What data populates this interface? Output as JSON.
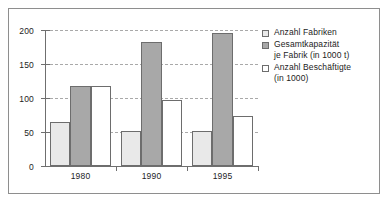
{
  "chart_data": {
    "type": "bar",
    "title": "",
    "subtitle": "",
    "xlabel": "",
    "ylabel": "",
    "categories": [
      "1980",
      "1990",
      "1995"
    ],
    "series": [
      {
        "name": "Anzahl Fabriken",
        "name_line1": "Anzahl Fabriken",
        "name_line2": "",
        "color": "#e9e9e9",
        "values": [
          64,
          51,
          51
        ]
      },
      {
        "name": "Gesamtkapazität je Fabrik (in 1000 t)",
        "name_line1": "Gesamtkapazität",
        "name_line2": "je Fabrik (in 1000 t)",
        "color": "#a8a8a8",
        "values": [
          117,
          183,
          195
        ]
      },
      {
        "name": "Anzahl Beschäftigte (in 1000)",
        "name_line1": "Anzahl Beschäftigte",
        "name_line2": "(in 1000)",
        "color": "#ffffff",
        "values": [
          117,
          97,
          74
        ]
      }
    ],
    "ylim": [
      0,
      200
    ],
    "yticks": [
      0,
      50,
      100,
      150,
      200
    ],
    "ytick_labels": [
      "0",
      "50",
      "100",
      "150",
      "200"
    ],
    "grid": true,
    "grid_style": "dashed",
    "grid_axis": "y",
    "legend_position": "right",
    "bar_border_color": "#6d6d6d",
    "axis_color": "#6f6f6f",
    "frame_color": "#8e8e8e",
    "background": "#ffffff"
  }
}
